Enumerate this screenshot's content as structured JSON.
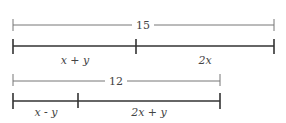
{
  "diagrams": [
    {
      "total_label": "15",
      "segments": [
        {
          "label": "x + y"
        },
        {
          "label": "2x"
        }
      ]
    },
    {
      "total_label": "12",
      "segments": [
        {
          "label": "x - y"
        },
        {
          "label": "2x + y"
        }
      ]
    }
  ],
  "colors": {
    "thin_line": "#777777",
    "thick_line": "#333333",
    "text": "#444444"
  }
}
